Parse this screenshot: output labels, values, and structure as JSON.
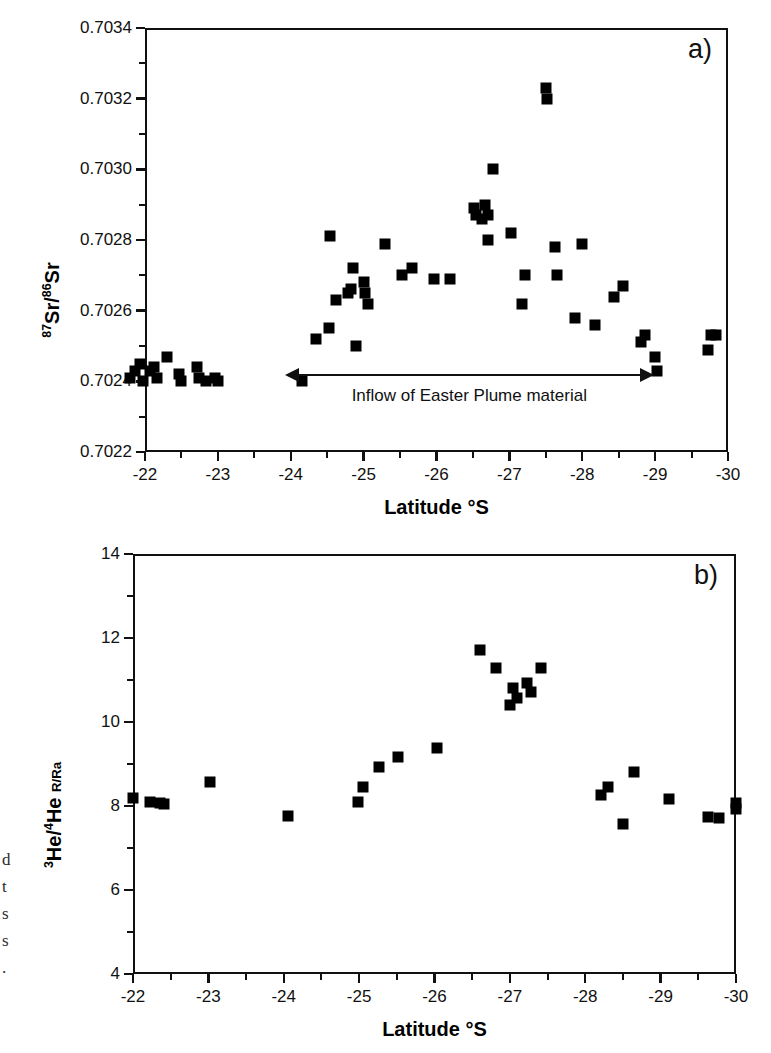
{
  "figure": {
    "margin_caption_fragments": [
      "d",
      "t",
      "s",
      "s",
      "."
    ]
  },
  "panel_a": {
    "letter": "a)",
    "annotation": {
      "text": "Inflow of Easter Plume material",
      "x_start": -24.1,
      "x_end": -28.8,
      "y": 0.70242
    }
  },
  "panel_b": {
    "letter": "b)"
  },
  "chart_data": [
    {
      "type": "scatter",
      "panel": "a",
      "title": "",
      "xlabel": "Latitude °S",
      "ylabel": "87Sr/86Sr",
      "ylabel_parts": {
        "sup1": "87",
        "base1": "Sr/",
        "sup2": "86",
        "base2": "Sr"
      },
      "xlim": [
        -22,
        -30
      ],
      "ylim": [
        0.7022,
        0.7034
      ],
      "x_ticks": [
        -22,
        -23,
        -24,
        -25,
        -26,
        -27,
        -28,
        -29,
        -30
      ],
      "x_tick_labels": [
        "-22",
        "-23",
        "-24",
        "-25",
        "-26",
        "-27",
        "-28",
        "-29",
        "-30"
      ],
      "y_ticks": [
        0.7022,
        0.7024,
        0.7026,
        0.7028,
        0.703,
        0.7032,
        0.7034
      ],
      "y_tick_labels": [
        "0.7022",
        "0.7024",
        "0.7026",
        "0.7028",
        "0.7030",
        "0.7032",
        "0.7034"
      ],
      "x_minor_step": 0.5,
      "y_minor_step": 0.0001,
      "grid": false,
      "legend": false,
      "marker": "filled-square",
      "marker_color": "#000000",
      "points": [
        [
          -21.8,
          0.70241
        ],
        [
          -21.86,
          0.70243
        ],
        [
          -21.93,
          0.70245
        ],
        [
          -21.97,
          0.7024
        ],
        [
          -22.07,
          0.70243
        ],
        [
          -22.13,
          0.70244
        ],
        [
          -22.16,
          0.70241
        ],
        [
          -22.3,
          0.70247
        ],
        [
          -22.46,
          0.70242
        ],
        [
          -22.5,
          0.7024
        ],
        [
          -22.72,
          0.70244
        ],
        [
          -22.74,
          0.70241
        ],
        [
          -22.84,
          0.7024
        ],
        [
          -22.96,
          0.70241
        ],
        [
          -23.0,
          0.7024
        ],
        [
          -24.15,
          0.7024
        ],
        [
          -24.35,
          0.70252
        ],
        [
          -24.52,
          0.70255
        ],
        [
          -24.54,
          0.70281
        ],
        [
          -24.62,
          0.70263
        ],
        [
          -24.78,
          0.70265
        ],
        [
          -24.82,
          0.70266
        ],
        [
          -24.86,
          0.70272
        ],
        [
          -24.9,
          0.7025
        ],
        [
          -25.0,
          0.70268
        ],
        [
          -25.02,
          0.70265
        ],
        [
          -25.06,
          0.70262
        ],
        [
          -25.3,
          0.70279
        ],
        [
          -25.52,
          0.7027
        ],
        [
          -25.66,
          0.70272
        ],
        [
          -25.96,
          0.70269
        ],
        [
          -26.18,
          0.70269
        ],
        [
          -26.52,
          0.70289
        ],
        [
          -26.54,
          0.70287
        ],
        [
          -26.62,
          0.70286
        ],
        [
          -26.66,
          0.7029
        ],
        [
          -26.7,
          0.70287
        ],
        [
          -26.7,
          0.7028
        ],
        [
          -26.78,
          0.703
        ],
        [
          -27.02,
          0.70282
        ],
        [
          -27.18,
          0.70262
        ],
        [
          -27.22,
          0.7027
        ],
        [
          -27.5,
          0.70323
        ],
        [
          -27.52,
          0.7032
        ],
        [
          -27.62,
          0.70278
        ],
        [
          -27.66,
          0.7027
        ],
        [
          -27.9,
          0.70258
        ],
        [
          -28.0,
          0.70279
        ],
        [
          -28.18,
          0.70256
        ],
        [
          -28.44,
          0.70264
        ],
        [
          -28.56,
          0.70267
        ],
        [
          -28.8,
          0.70251
        ],
        [
          -28.86,
          0.70253
        ],
        [
          -29.0,
          0.70247
        ],
        [
          -29.02,
          0.70243
        ],
        [
          -29.72,
          0.70249
        ],
        [
          -29.76,
          0.70253
        ],
        [
          -29.84,
          0.70253
        ]
      ]
    },
    {
      "type": "scatter",
      "panel": "b",
      "title": "",
      "xlabel": "Latitude °S",
      "ylabel": "3He/4He R/Ra",
      "ylabel_parts": {
        "sup1": "3",
        "base1": "He/",
        "sup2": "4",
        "base2": "He",
        "sub": "R/Ra"
      },
      "xlim": [
        -22,
        -30
      ],
      "ylim": [
        4,
        14
      ],
      "x_ticks": [
        -22,
        -23,
        -24,
        -25,
        -26,
        -27,
        -28,
        -29,
        -30
      ],
      "x_tick_labels": [
        "-22",
        "-23",
        "-24",
        "-25",
        "-26",
        "-27",
        "-28",
        "-29",
        "-30"
      ],
      "y_ticks": [
        4,
        6,
        8,
        10,
        12,
        14
      ],
      "y_tick_labels": [
        "4",
        "6",
        "8",
        "10",
        "12",
        "14"
      ],
      "x_minor_step": 0.5,
      "y_minor_step": 1,
      "grid": false,
      "legend": false,
      "marker": "filled-square",
      "marker_color": "#000000",
      "points": [
        [
          -21.82,
          8.18
        ],
        [
          -22.08,
          8.1
        ],
        [
          -22.22,
          8.07
        ],
        [
          -22.28,
          8.05
        ],
        [
          -22.96,
          8.56
        ],
        [
          -24.12,
          7.76
        ],
        [
          -25.16,
          8.1
        ],
        [
          -25.24,
          8.46
        ],
        [
          -25.48,
          8.92
        ],
        [
          -25.76,
          9.16
        ],
        [
          -26.34,
          9.38
        ],
        [
          -26.98,
          11.72
        ],
        [
          -27.22,
          11.28
        ],
        [
          -27.46,
          10.82
        ],
        [
          -27.42,
          10.4
        ],
        [
          -27.52,
          10.58
        ],
        [
          -27.68,
          10.92
        ],
        [
          -27.74,
          10.72
        ],
        [
          -27.88,
          11.28
        ],
        [
          -28.78,
          8.26
        ],
        [
          -28.88,
          8.46
        ],
        [
          -29.1,
          7.58
        ],
        [
          -29.26,
          8.82
        ],
        [
          -29.78,
          8.16
        ],
        [
          -30.36,
          7.74
        ],
        [
          -30.52,
          7.72
        ],
        [
          -30.78,
          7.92
        ],
        [
          -30.78,
          8.06
        ]
      ],
      "points_note": "panel b x values mapped to latitude scale -22..-30"
    }
  ]
}
